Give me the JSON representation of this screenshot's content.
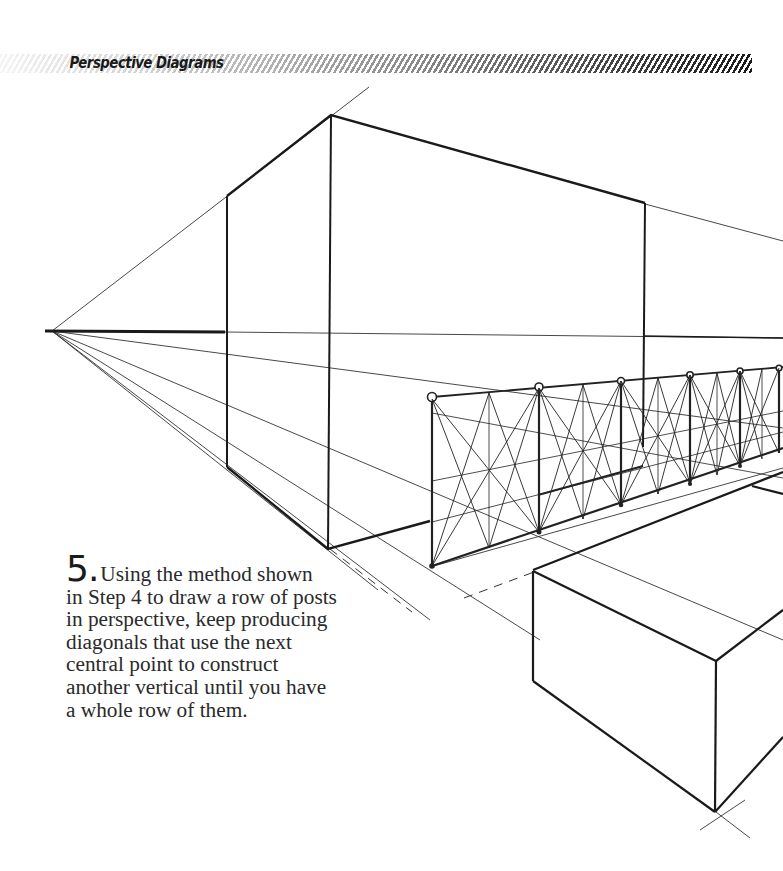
{
  "header": {
    "title": "Perspective Diagrams"
  },
  "step": {
    "number": "5.",
    "lines": [
      "Using the method shown",
      "in Step 4 to draw a row of posts",
      "in perspective, keep producing",
      "diagonals that use the next",
      "central point to construct",
      "another vertical until you have",
      "a whole row of them."
    ]
  },
  "diagram": {
    "vanishing_point": {
      "x": 52,
      "y": 331
    },
    "fence_post_count": 7,
    "colors": {
      "ink": "#1a1a1a",
      "construction_line": "#333333",
      "paper": "#ffffff"
    }
  }
}
